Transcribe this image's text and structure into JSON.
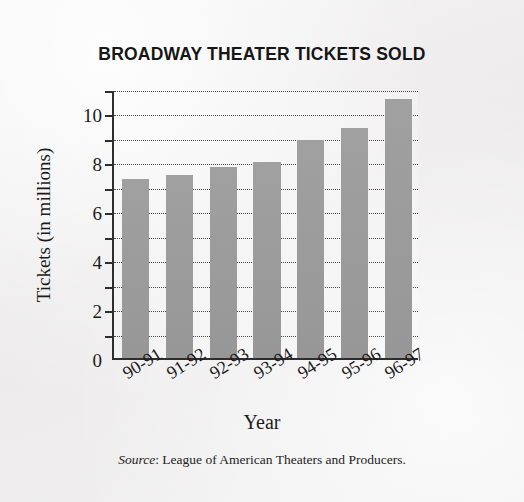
{
  "chart_data": {
    "type": "bar",
    "title": "BROADWAY THEATER TICKETS SOLD",
    "xlabel": "Year",
    "ylabel": "Tickets (in millions)",
    "categories": [
      "90-91",
      "91-92",
      "92-93",
      "93-94",
      "94-95",
      "95-96",
      "96-97"
    ],
    "values": [
      7.3,
      7.5,
      7.8,
      8.0,
      8.9,
      9.4,
      10.6
    ],
    "ylim": [
      0,
      11
    ],
    "yticks": [
      0,
      2,
      4,
      6,
      8,
      10
    ],
    "minor_yticks": [
      1,
      3,
      5,
      7,
      9,
      11
    ],
    "grid": "horizontal-dotted",
    "legend": "none",
    "bar_color": "#9b9b9b",
    "axis_color": "#2e2e2e",
    "xtick_rotation": 32
  },
  "source_note": {
    "label": "Source",
    "separator": ": ",
    "text": "League of American Theaters and Producers."
  }
}
